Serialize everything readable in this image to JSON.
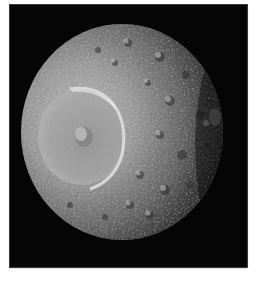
{
  "image": {
    "subject": "Saturn's moon Mimas with large Herschel impact crater",
    "alt": "Grayscale photograph of a heavily cratered moon against black space, lit from the left, with a large crater on the left hemisphere",
    "colors": {
      "page_background": "#ffffff",
      "space": "#050505",
      "frame_border": "#3a3a3a",
      "surface_highlight": "#c9c9c9",
      "surface_mid": "#8a8a8a",
      "surface_shadow": "#2a2a2a",
      "crater_rim": "#dedede"
    }
  }
}
